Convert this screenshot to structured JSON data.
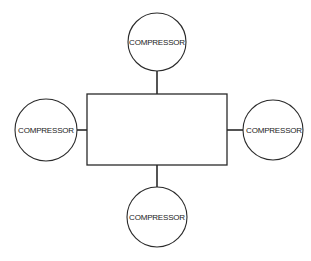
{
  "diagram": {
    "central_box": {
      "label": ""
    },
    "nodes": [
      {
        "id": "top",
        "label": "COMPRESSOR"
      },
      {
        "id": "left",
        "label": "COMPRESSOR"
      },
      {
        "id": "right",
        "label": "COMPRESSOR"
      },
      {
        "id": "bottom",
        "label": "COMPRESSOR"
      }
    ],
    "colors": {
      "line": "#2a2a2a",
      "background": "#ffffff"
    }
  }
}
